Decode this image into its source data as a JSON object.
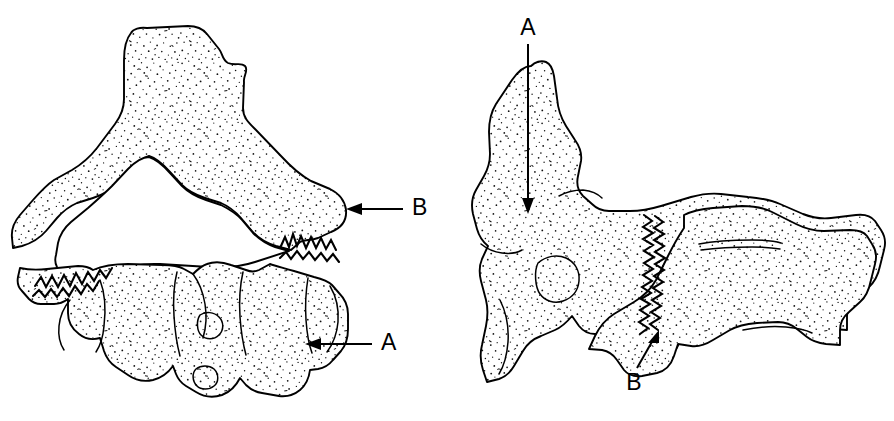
{
  "figure": {
    "background_color": "#ffffff",
    "ink_color": "#000000",
    "width": 894,
    "height": 421,
    "style": "stippled anatomical line drawing"
  },
  "panels": [
    {
      "id": "left-panel",
      "view_name": "superior-view",
      "annotations": [
        {
          "id": "left-label-b",
          "label": "B",
          "label_x": 419,
          "label_y": 209,
          "arrow_from_x": 403,
          "arrow_from_y": 209,
          "arrow_to_x": 348,
          "arrow_to_y": 209,
          "direction": "left"
        },
        {
          "id": "left-label-a",
          "label": "A",
          "label_x": 388,
          "label_y": 344,
          "arrow_from_x": 372,
          "arrow_from_y": 344,
          "arrow_to_x": 306,
          "arrow_to_y": 344,
          "direction": "left"
        }
      ]
    },
    {
      "id": "right-panel",
      "view_name": "lateral-view",
      "annotations": [
        {
          "id": "right-label-a",
          "label": "A",
          "label_x": 528,
          "label_y": 30,
          "arrow_from_x": 528,
          "arrow_from_y": 44,
          "arrow_to_x": 528,
          "arrow_to_y": 213,
          "direction": "down"
        },
        {
          "id": "right-label-b",
          "label": "B",
          "label_x": 638,
          "label_y": 382,
          "arrow_from_x": 638,
          "arrow_from_y": 368,
          "arrow_to_x": 658,
          "arrow_to_y": 332,
          "direction": "up-right"
        }
      ]
    }
  ],
  "legend_keys": [
    "A",
    "B"
  ]
}
